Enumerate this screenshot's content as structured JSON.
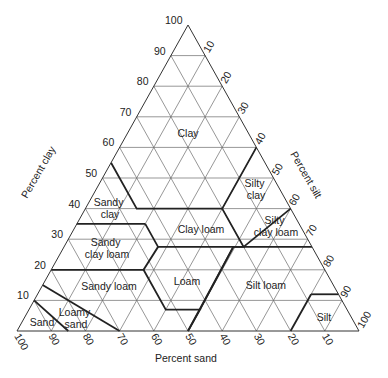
{
  "diagram": {
    "type": "ternary-soil-texture-triangle",
    "axes": {
      "clay": {
        "title": "Percent clay",
        "ticks": [
          "10",
          "20",
          "30",
          "40",
          "50",
          "60",
          "70",
          "80",
          "90",
          "100"
        ]
      },
      "silt": {
        "title": "Percent silt",
        "ticks": [
          "10",
          "20",
          "30",
          "40",
          "50",
          "60",
          "70",
          "80",
          "90",
          "100"
        ]
      },
      "sand": {
        "title": "Percent sand",
        "ticks": [
          "100",
          "90",
          "80",
          "70",
          "60",
          "50",
          "40",
          "30",
          "20",
          "10"
        ]
      }
    },
    "regions": [
      {
        "id": "clay",
        "label": "Clay"
      },
      {
        "id": "sandy-clay",
        "label_lines": [
          "Sandy",
          "clay"
        ]
      },
      {
        "id": "silty-clay",
        "label_lines": [
          "Silty",
          "clay"
        ]
      },
      {
        "id": "sandy-clay-loam",
        "label_lines": [
          "Sandy",
          "clay loam"
        ]
      },
      {
        "id": "clay-loam",
        "label": "Clay loam"
      },
      {
        "id": "silty-clay-loam",
        "label_lines": [
          "Silty",
          "clay loam"
        ]
      },
      {
        "id": "sandy-loam",
        "label": "Sandy loam"
      },
      {
        "id": "loam",
        "label": "Loam"
      },
      {
        "id": "silt-loam",
        "label": "Silt loam"
      },
      {
        "id": "silt",
        "label": "Silt"
      },
      {
        "id": "loamy-sand",
        "label_lines": [
          "Loamy",
          "sand"
        ]
      },
      {
        "id": "sand",
        "label": "Sand"
      }
    ]
  }
}
